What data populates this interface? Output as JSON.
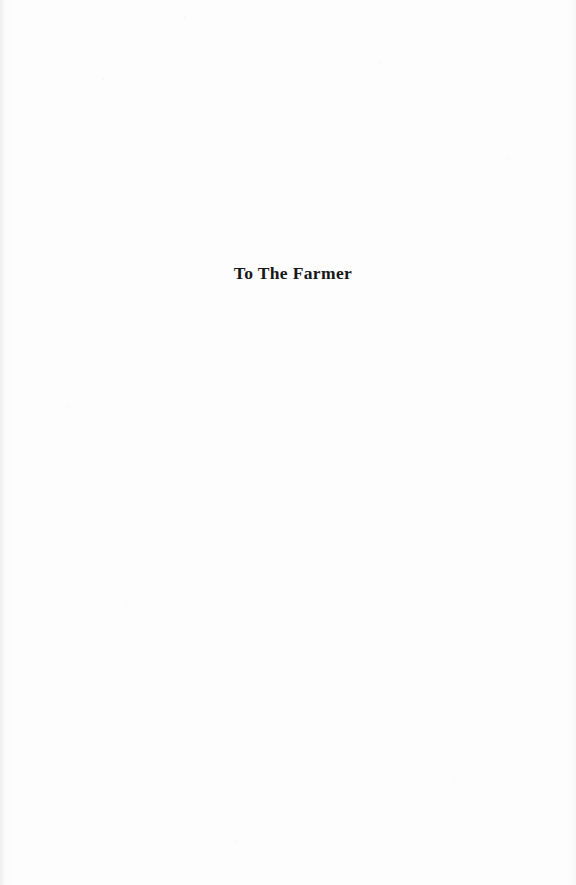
{
  "document": {
    "type": "scanned-book-page",
    "page_kind": "dedication",
    "background_color": "#fdfdfd",
    "text_color": "#171717",
    "width": 576,
    "height": 885
  },
  "dedication": {
    "text": "To The Farmer"
  }
}
